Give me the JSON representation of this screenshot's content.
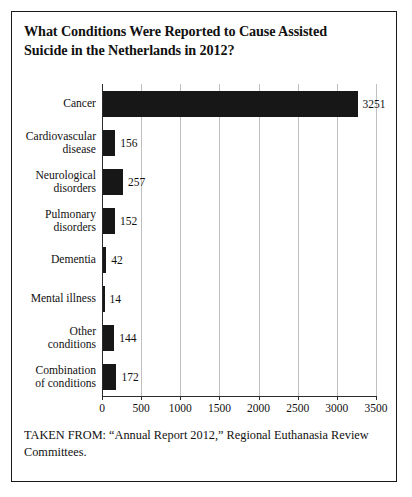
{
  "figure": {
    "title_lines": [
      "What Conditions Were Reported to Cause Assisted",
      "Suicide in the Netherlands in 2012?"
    ],
    "source_note": "TAKEN FROM: “Annual Report 2012,” Regional Euthanasia Review Committees.",
    "border_color": "#1a1a1a",
    "bar_color": "#171717",
    "gridline_color": "#bfbfbf",
    "axis_color": "#2b2b2b",
    "background_color": "#ffffff"
  },
  "chart_data": {
    "type": "bar",
    "orientation": "horizontal",
    "title": "What Conditions Were Reported to Cause Assisted Suicide in the Netherlands in 2012?",
    "xlabel": "",
    "ylabel": "",
    "xlim": [
      0,
      3500
    ],
    "grid": true,
    "legend": "none",
    "categories": [
      "Cancer",
      "Cardiovascular disease",
      "Neurological disorders",
      "Pulmonary disorders",
      "Dementia",
      "Mental illness",
      "Other conditions",
      "Combination of conditions"
    ],
    "category_label_lines": [
      [
        "Cancer"
      ],
      [
        "Cardiovascular",
        "disease"
      ],
      [
        "Neurological",
        "disorders"
      ],
      [
        "Pulmonary",
        "disorders"
      ],
      [
        "Dementia"
      ],
      [
        "Mental illness"
      ],
      [
        "Other",
        "conditions"
      ],
      [
        "Combination",
        "of conditions"
      ]
    ],
    "values": [
      3251,
      156,
      257,
      152,
      42,
      14,
      144,
      172
    ],
    "value_labels": [
      "3251",
      "156",
      "257",
      "152",
      "42",
      "14",
      "144",
      "172"
    ],
    "xticks": [
      0,
      500,
      1000,
      1500,
      2000,
      2500,
      3000,
      3500
    ],
    "xtick_labels": [
      "0",
      "500",
      "1000",
      "1500",
      "2000",
      "2500",
      "3000",
      "3500"
    ]
  }
}
